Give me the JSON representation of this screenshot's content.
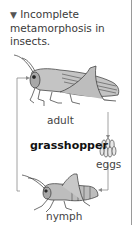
{
  "caption": {
    "marker": "▼",
    "text": "Incomplete metamorphosis in insects."
  },
  "diagram": {
    "title": "grasshopper",
    "stages": [
      {
        "id": "adult",
        "label": "adult"
      },
      {
        "id": "eggs",
        "label": "eggs"
      },
      {
        "id": "nymph",
        "label": "nymph"
      }
    ],
    "colors": {
      "line": "#8a8a8a",
      "insect_fill": "#b5b5b5",
      "insect_stroke": "#333333",
      "text": "#444444"
    }
  }
}
